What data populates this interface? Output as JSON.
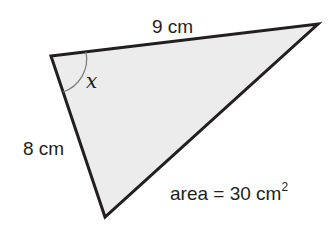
{
  "diagram": {
    "type": "triangle",
    "colors": {
      "fill": "#ececec",
      "stroke": "#231f20",
      "arc": "#808080",
      "text": "#231f20"
    },
    "vertices": {
      "top_left": [
        51,
        56
      ],
      "top_right": [
        318,
        24
      ],
      "bottom": [
        105,
        217
      ]
    },
    "labels": {
      "top_side": "9 cm",
      "left_side": "8 cm",
      "angle": "x",
      "area_prefix": "area = 30 cm",
      "area_exponent": "2"
    }
  }
}
